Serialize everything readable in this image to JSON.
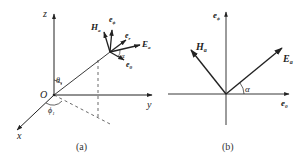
{
  "figure": {
    "panel_a": {
      "caption": "(a)",
      "axes": {
        "z": "z",
        "y": "y",
        "x": "x",
        "origin": "O"
      },
      "angles": {
        "theta": "θ",
        "theta_sub": "1",
        "phi": "ϕ",
        "phi_sub": "1",
        "alpha": "α"
      },
      "vectors": {
        "H": "H",
        "H_sub": "a",
        "e_phi": "e",
        "e_phi_sub": "ϕ",
        "e_r": "e",
        "e_r_sub": "r",
        "E": "E",
        "E_sub": "a",
        "e_theta": "e",
        "e_theta_sub": "θ"
      }
    },
    "panel_b": {
      "caption": "(b)",
      "axes": {
        "vertical": "e",
        "vertical_sub": "ϕ",
        "horizontal": "e",
        "horizontal_sub": "θ"
      },
      "vectors": {
        "H": "H",
        "H_sub": "a",
        "E": "E",
        "E_sub": "a"
      },
      "angle": "α"
    }
  },
  "colors": {
    "stroke": "#222222",
    "dash": "#444444",
    "background": "#ffffff"
  }
}
